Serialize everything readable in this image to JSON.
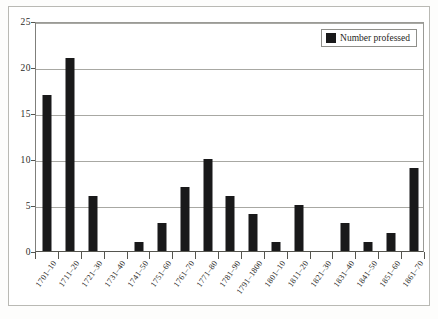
{
  "chart_data": {
    "type": "bar",
    "title": "",
    "subtitle": "",
    "xlabel": "",
    "ylabel": "",
    "ylim": [
      0,
      25
    ],
    "yticks": [
      0,
      5,
      10,
      15,
      20,
      25
    ],
    "grid": true,
    "legend_position": "top-right",
    "categories": [
      "1701–10",
      "1711–20",
      "1721–30",
      "1731–40",
      "1741–50",
      "1751–60",
      "1761–70",
      "1771–80",
      "1781–90",
      "1791–1800",
      "1801–10",
      "1811–20",
      "1821–30",
      "1831–40",
      "1841–50",
      "1851–60",
      "1861–70"
    ],
    "series": [
      {
        "name": "Number professed",
        "color": "#19191a",
        "values": [
          17,
          21,
          6,
          0,
          1,
          3,
          7,
          10,
          6,
          4,
          1,
          5,
          0,
          3,
          1,
          2,
          9
        ]
      }
    ]
  },
  "legend": {
    "label": "Number professed"
  },
  "axis": {
    "y_tick_labels": [
      "0",
      "5",
      "10",
      "15",
      "20",
      "25"
    ]
  }
}
